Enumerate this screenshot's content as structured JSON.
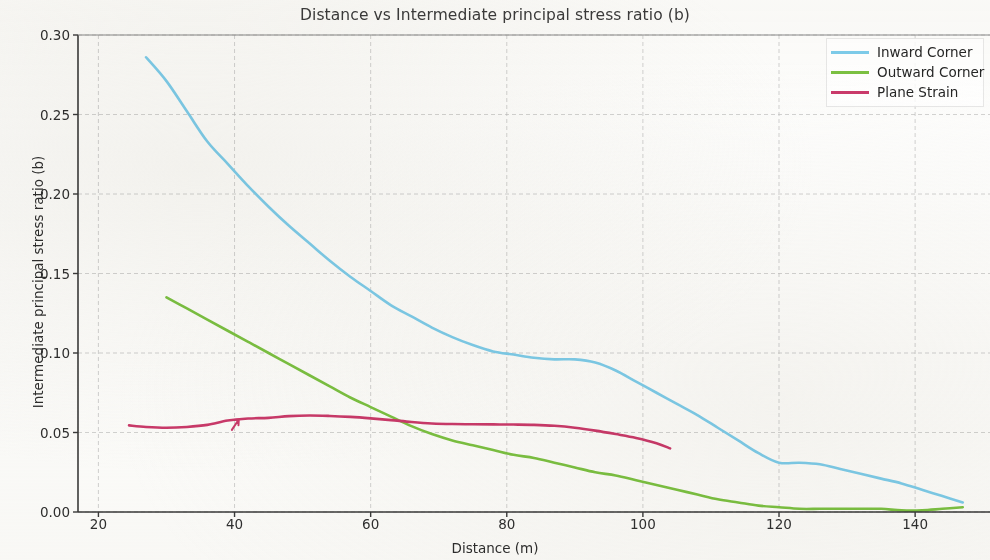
{
  "chart_data": {
    "type": "line",
    "title": "Distance vs Intermediate principal stress ratio (b)",
    "xlabel": "Distance (m)",
    "ylabel": "Intermediate principal stress ratio (b)",
    "xlim": [
      17,
      151
    ],
    "ylim": [
      0.0,
      0.3
    ],
    "xticks": [
      20,
      40,
      60,
      80,
      100,
      120,
      140
    ],
    "xtick_labels": [
      "20",
      "40",
      "60",
      "80",
      "100",
      "120",
      "140"
    ],
    "yticks": [
      0.0,
      0.05,
      0.1,
      0.15,
      0.2,
      0.25,
      0.3
    ],
    "ytick_labels": [
      "0.00",
      "0.05",
      "0.10",
      "0.15",
      "0.20",
      "0.25",
      "0.30"
    ],
    "grid": true,
    "legend_position": "upper right",
    "colors": {
      "inward_corner": "#7ECDEC",
      "outward_corner": "#7CC242",
      "plane_strain": "#CB3A6B",
      "grid": "#bdbdbd",
      "axis": "#3a3a3a",
      "text": "#2e2e2e",
      "background": "#fcfcfb"
    },
    "series": [
      {
        "name": "Inward Corner",
        "color": "#7ECDEC",
        "x": [
          27.0,
          30.0,
          33.0,
          36.0,
          39.0,
          42.0,
          45.0,
          48.0,
          51.0,
          54.0,
          57.0,
          60.0,
          63.0,
          66.0,
          69.0,
          72.0,
          75.0,
          78.0,
          81.0,
          84.0,
          87.0,
          90.0,
          93.0,
          96.0,
          99.0,
          102.0,
          105.0,
          108.0,
          111.0,
          114.0,
          117.0,
          120.0,
          123.0,
          126.0,
          129.0,
          132.0,
          135.0,
          138.0,
          141.0,
          144.0,
          147.0
        ],
        "y": [
          0.286,
          0.271,
          0.252,
          0.233,
          0.219,
          0.205,
          0.192,
          0.18,
          0.169,
          0.158,
          0.148,
          0.139,
          0.13,
          0.123,
          0.116,
          0.11,
          0.105,
          0.101,
          0.099,
          0.097,
          0.096,
          0.096,
          0.094,
          0.089,
          0.082,
          0.075,
          0.068,
          0.061,
          0.053,
          0.045,
          0.037,
          0.031,
          0.031,
          0.03,
          0.027,
          0.024,
          0.021,
          0.018,
          0.014,
          0.01,
          0.006
        ]
      },
      {
        "name": "Outward Corner",
        "color": "#7CC242",
        "x": [
          30.0,
          33.0,
          36.0,
          39.0,
          42.0,
          45.0,
          48.0,
          51.0,
          54.0,
          57.0,
          60.0,
          63.0,
          66.0,
          69.0,
          72.0,
          75.0,
          78.0,
          81.0,
          84.0,
          87.0,
          90.0,
          93.0,
          96.0,
          99.0,
          102.0,
          105.0,
          108.0,
          111.0,
          114.0,
          117.0,
          120.0,
          123.0,
          126.0,
          129.0,
          132.0,
          135.0,
          138.0,
          141.0,
          144.0,
          147.0
        ],
        "y": [
          0.135,
          0.128,
          0.121,
          0.114,
          0.107,
          0.1,
          0.093,
          0.086,
          0.079,
          0.072,
          0.066,
          0.06,
          0.054,
          0.049,
          0.045,
          0.042,
          0.039,
          0.036,
          0.034,
          0.031,
          0.028,
          0.025,
          0.023,
          0.02,
          0.017,
          0.014,
          0.011,
          0.008,
          0.006,
          0.004,
          0.003,
          0.002,
          0.002,
          0.002,
          0.002,
          0.002,
          0.001,
          0.001,
          0.002,
          0.003
        ]
      },
      {
        "name": "Plane Strain",
        "color": "#CB3A6B",
        "x": [
          24.5,
          27.0,
          30.0,
          33.0,
          36.0,
          39.0,
          42.0,
          45.0,
          48.0,
          51.0,
          54.0,
          57.0,
          60.0,
          63.0,
          66.0,
          69.0,
          72.0,
          75.0,
          78.0,
          81.0,
          84.0,
          87.0,
          90.0,
          93.0,
          96.0,
          99.0,
          102.0,
          104.0
        ],
        "y": [
          0.0545,
          0.0535,
          0.053,
          0.0535,
          0.0548,
          0.0575,
          0.0588,
          0.0592,
          0.0603,
          0.0607,
          0.0604,
          0.0598,
          0.0589,
          0.0578,
          0.0566,
          0.0557,
          0.0553,
          0.0552,
          0.0551,
          0.055,
          0.0548,
          0.0542,
          0.053,
          0.0512,
          0.049,
          0.0466,
          0.0433,
          0.04
        ]
      }
    ],
    "annotations": [
      {
        "name": "arrow-marker",
        "x": 40.5,
        "y": 0.0565,
        "angle": -28
      }
    ]
  },
  "legend": {
    "items": [
      {
        "label": "Inward Corner"
      },
      {
        "label": "Outward Corner"
      },
      {
        "label": "Plane Strain"
      }
    ]
  }
}
